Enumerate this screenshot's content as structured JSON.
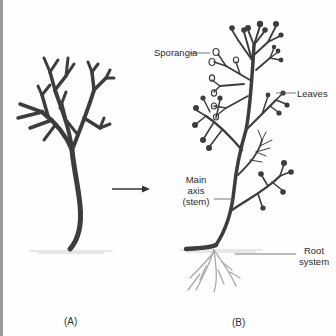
{
  "figure": {
    "panel_a": {
      "caption": "(A)"
    },
    "panel_b": {
      "caption": "(B)",
      "labels": {
        "sporangia": "Sporangia",
        "leaves": "Leaves",
        "main_axis_line1": "Main",
        "main_axis_line2": "axis",
        "main_axis_line3": "(stem)",
        "root_line1": "Root",
        "root_line2": "system"
      }
    },
    "arrow": {
      "direction": "right",
      "meaning": "evolves-to"
    },
    "colors": {
      "plant": "#3d3d3d",
      "root": "#a9a9a9",
      "label_text": "#2a2a2a",
      "leader_line": "#555555",
      "ground": "#cfcfcf"
    }
  }
}
